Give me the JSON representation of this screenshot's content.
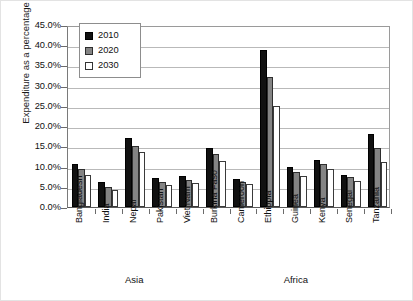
{
  "chart_data": {
    "type": "bar",
    "title": "",
    "xlabel": "",
    "ylabel": "Expenditure as a percentage of GDP",
    "ylim": [
      0,
      45
    ],
    "ytick_labels": [
      "45.0%",
      "40.0%",
      "35.0%",
      "30.0%",
      "25.0%",
      "20.0%",
      "15.0%",
      "10.0%",
      "5.0%",
      "0.0%"
    ],
    "ytick_values": [
      45,
      40,
      35,
      30,
      25,
      20,
      15,
      10,
      5,
      0
    ],
    "grid": true,
    "legend_position": "top-left",
    "categories": [
      "Bangladesh",
      "India",
      "Nepal",
      "Pakistan",
      "Viet Nam",
      "Burkina Faso",
      "Cameroon",
      "Ethiopia",
      "Guinea",
      "Kenya",
      "Senegal",
      "Tanzania"
    ],
    "groups": [
      {
        "label": "Asia",
        "categories": [
          "Bangladesh",
          "India",
          "Nepal",
          "Pakistan",
          "Viet Nam"
        ]
      },
      {
        "label": "Africa",
        "categories": [
          "Burkina Faso",
          "Cameroon",
          "Ethiopia",
          "Guinea",
          "Kenya",
          "Senegal",
          "Tanzania"
        ]
      }
    ],
    "series": [
      {
        "name": "2010",
        "color": "#111111",
        "values": [
          10.7,
          6.2,
          17.0,
          7.1,
          7.6,
          14.7,
          7.0,
          38.8,
          9.8,
          11.6,
          8.0,
          18.0
        ]
      },
      {
        "name": "2020",
        "color": "#848484",
        "values": [
          9.3,
          5.0,
          15.2,
          6.3,
          6.8,
          13.0,
          6.2,
          32.2,
          8.6,
          10.6,
          7.3,
          14.6
        ]
      },
      {
        "name": "2030",
        "color": "#ffffff",
        "values": [
          8.0,
          4.2,
          13.5,
          5.4,
          5.9,
          11.5,
          5.6,
          25.0,
          7.6,
          9.5,
          6.4,
          11.2
        ]
      }
    ]
  }
}
